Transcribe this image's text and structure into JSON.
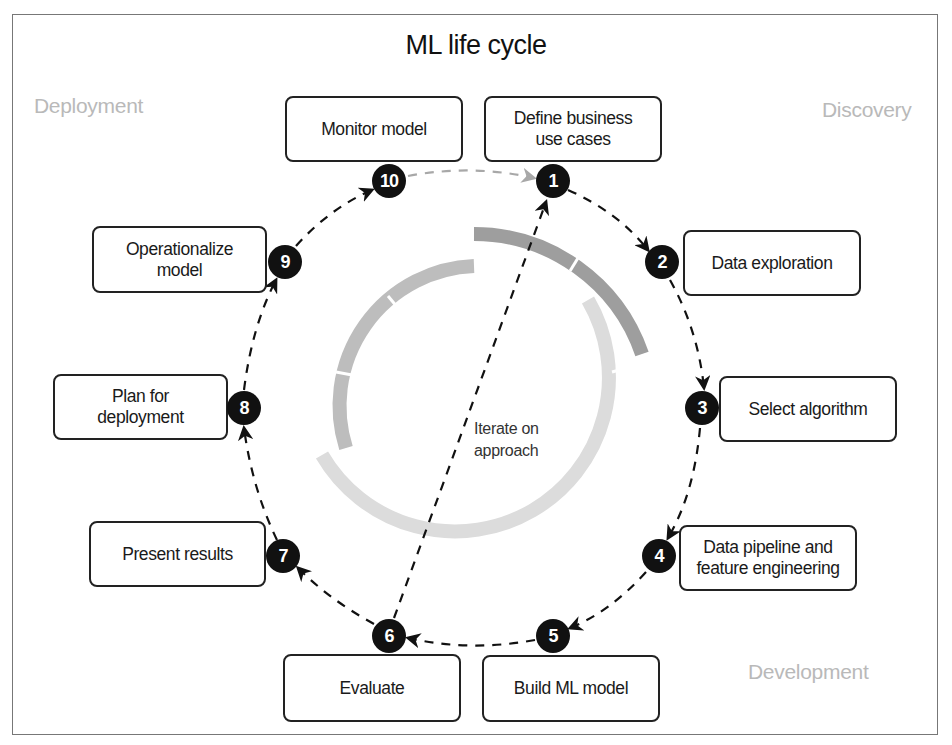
{
  "title": "ML life cycle",
  "phases": {
    "deployment": "Deployment",
    "discovery": "Discovery",
    "development": "Development"
  },
  "center_label": "Iterate on\napproach",
  "steps": [
    {
      "number": "1",
      "label": "Define business\nuse cases",
      "phase": "Discovery"
    },
    {
      "number": "2",
      "label": "Data exploration",
      "phase": "Discovery"
    },
    {
      "number": "3",
      "label": "Select algorithm",
      "phase": "Development"
    },
    {
      "number": "4",
      "label": "Data pipeline and\nfeature engineering",
      "phase": "Development"
    },
    {
      "number": "5",
      "label": "Build ML model",
      "phase": "Development"
    },
    {
      "number": "6",
      "label": "Evaluate",
      "phase": "Development"
    },
    {
      "number": "7",
      "label": "Present results",
      "phase": "Development"
    },
    {
      "number": "8",
      "label": "Plan for\ndeployment",
      "phase": "Deployment"
    },
    {
      "number": "9",
      "label": "Operationalize\nmodel",
      "phase": "Deployment"
    },
    {
      "number": "10",
      "label": "Monitor model",
      "phase": "Deployment"
    }
  ],
  "colors": {
    "discovery_arc": "#9e9e9e",
    "development_arc": "#dcdcdc",
    "deployment_arc": "#bdbdbd",
    "node_fill": "#111111",
    "phase_label": "#b9b9b9",
    "loop_back_arrow": "#a8a8a8"
  }
}
